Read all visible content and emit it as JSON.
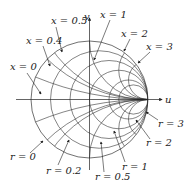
{
  "diagram": {
    "type": "smith-chart",
    "axes": {
      "horizontal": "u",
      "vertical": "v"
    },
    "center": [
      89.5,
      99.5
    ],
    "radius": 58.5,
    "resistance_circles": [
      0,
      0.2,
      0.5,
      1,
      2,
      3
    ],
    "reactance_arcs": [
      0.4,
      0.5,
      1,
      2,
      3
    ],
    "labels": {
      "x0": "x = 0",
      "x04": "x = 0.4",
      "x05": "x = 0.5",
      "x1": "x = 1",
      "x2": "x = 2",
      "x3": "x = 3",
      "r0": "r = 0",
      "r02": "r = 0.2",
      "r05": "r = 0.5",
      "r1": "r = 1",
      "r2": "r = 2",
      "r3": "r = 3",
      "u": "u",
      "v": "v"
    },
    "line_color": "#333333"
  }
}
